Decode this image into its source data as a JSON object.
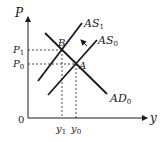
{
  "diagram": {
    "type": "AS-AD economics diagram",
    "axes": {
      "y_label": "P",
      "x_label": "y",
      "origin_label": "0"
    },
    "curves": [
      {
        "name": "AS",
        "subscript": "1",
        "label": "AS1"
      },
      {
        "name": "AS",
        "subscript": "0",
        "label": "AS0"
      },
      {
        "name": "AD",
        "subscript": "0",
        "label": "AD0"
      }
    ],
    "points": [
      {
        "label": "B"
      },
      {
        "label": "A"
      }
    ],
    "price_levels": [
      {
        "name": "P",
        "subscript": "1"
      },
      {
        "name": "P",
        "subscript": "0"
      }
    ],
    "outputs": [
      {
        "name": "y",
        "subscript": "1"
      },
      {
        "name": "y",
        "subscript": "0"
      }
    ],
    "shift_arrow": "AS shifts left from AS0 to AS1",
    "colors": {
      "line": "#1a1a1a",
      "background": "#ffffff"
    }
  }
}
